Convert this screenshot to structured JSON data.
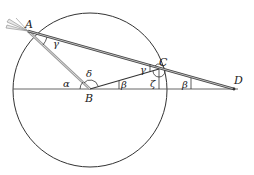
{
  "figure": {
    "type": "geometry-diagram",
    "circle": {
      "cx": 90,
      "cy": 90,
      "r": 77,
      "stroke": "#333333"
    },
    "baseline": {
      "x1": 13,
      "y1": 89,
      "x2": 240,
      "y2": 89,
      "stroke": "#555555"
    },
    "points": {
      "A": {
        "x": 28,
        "y": 31,
        "label": "A"
      },
      "B": {
        "x": 90,
        "y": 89,
        "label": "B"
      },
      "C": {
        "x": 159,
        "y": 69,
        "label": "C"
      },
      "D": {
        "x": 234,
        "y": 89,
        "label": "D"
      }
    },
    "angle_labels": {
      "alpha": "α",
      "delta": "δ",
      "gamma_at_A": "γ",
      "gamma_at_C": "γ",
      "beta_at_B": "β",
      "beta_at_D": "β",
      "zeta": "ζ"
    },
    "colors": {
      "line_dark": "#333333",
      "line_gray": "#9a9a9a",
      "line_light": "#cfcfcf"
    }
  }
}
